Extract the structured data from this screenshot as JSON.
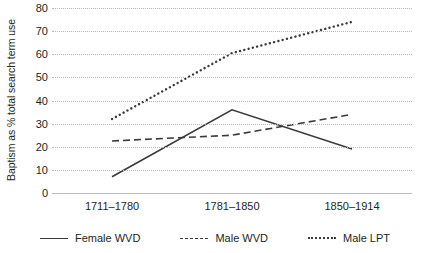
{
  "chart_data": {
    "type": "line",
    "title": "",
    "xlabel": "",
    "ylabel": "Baptism as % total search term use",
    "categories": [
      "1711–1780",
      "1781–1850",
      "1850–1914"
    ],
    "ylim": [
      0,
      80
    ],
    "yticks": [
      0,
      10,
      20,
      30,
      40,
      50,
      60,
      70,
      80
    ],
    "ytick_labels": [
      "0",
      "10",
      "20",
      "30",
      "40",
      "50",
      "60",
      "70",
      "80"
    ],
    "grid": true,
    "legend_position": "bottom",
    "series": [
      {
        "name": "Female WVD",
        "style": "solid",
        "color": "#3a3a3a",
        "values": [
          7,
          36,
          19
        ]
      },
      {
        "name": "Male WVD",
        "style": "dashed",
        "color": "#3a3a3a",
        "values": [
          22.5,
          25,
          34
        ]
      },
      {
        "name": "Male LPT",
        "style": "dotted",
        "color": "#3a3a3a",
        "values": [
          32,
          60.5,
          74
        ]
      }
    ]
  },
  "legend": {
    "items": [
      {
        "label": "Female WVD",
        "style": "solid"
      },
      {
        "label": "Male WVD",
        "style": "dashed"
      },
      {
        "label": "Male LPT",
        "style": "dotted"
      }
    ]
  },
  "colors": {
    "line": "#3a3a3a",
    "grid": "#b9b9b9",
    "axis": "#bcbcbc",
    "text": "#231f20",
    "background": "#ffffff"
  }
}
